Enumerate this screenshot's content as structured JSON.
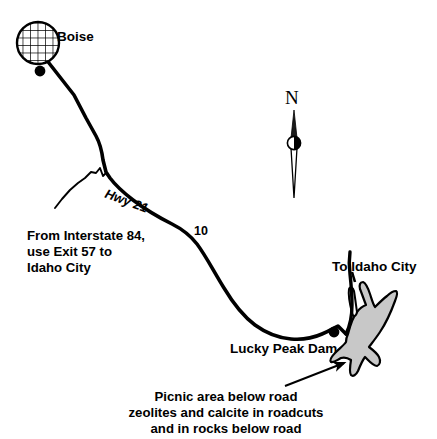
{
  "map": {
    "title": "Lucky Peak Dam area location map",
    "colors": {
      "ink": "#000000",
      "reservoir_fill": "#c8c8c8",
      "reservoir_stroke": "#000000",
      "background": "#ffffff"
    },
    "labels": {
      "boise": "Boise",
      "highway": "Hwy 21",
      "mile_marker": "10",
      "interstate_directions": "From Interstate 84,\nuse Exit 57 to\nIdaho City",
      "to_idaho_city": "To Idaho City",
      "lucky_peak_dam": "Lucky Peak Dam",
      "picnic_note": "Picnic area below road\nzeolites and calcite in roadcuts\nand in rocks below road",
      "north": "N"
    },
    "features": {
      "city_symbol": "boise-city-hatched-circle",
      "compass": "north-arrow-needle",
      "reservoir": "lucky-peak-reservoir",
      "road": "highway-21-route",
      "dam_marker": "lucky-peak-dam-dot",
      "pointer": "picnic-area-arrow"
    }
  }
}
